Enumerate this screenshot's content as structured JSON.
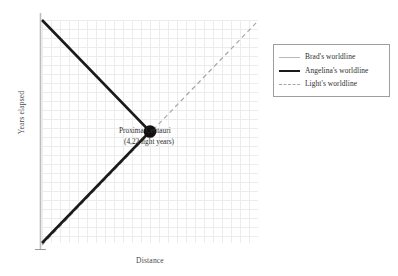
{
  "chart_data": {
    "type": "line",
    "title": "",
    "xlabel": "Distance",
    "ylabel": "Years elapsed",
    "grid": true,
    "legend_position": "right",
    "xlim": [
      0,
      8.44
    ],
    "ylim": [
      0,
      8.72
    ],
    "annotations": [
      {
        "name": "proxima-centauri",
        "line1": "Proxima Centauri",
        "line2": "(4,22 light years)",
        "x": 4.22,
        "y": 4.36,
        "marker": "filled-circle",
        "marker_color": "#101010"
      }
    ],
    "series": [
      {
        "name": "Brad's worldline",
        "legend_label": "Brad's worldline",
        "style": "solid",
        "width": 1.6,
        "color": "#bcbcbc",
        "points": [
          [
            0,
            0
          ],
          [
            0,
            8.72
          ]
        ]
      },
      {
        "name": "Angelina's worldline",
        "legend_label": "Angelina's worldline",
        "style": "solid",
        "width": 2.6,
        "color": "#1a1a1a",
        "points": [
          [
            0,
            0
          ],
          [
            4.22,
            4.36
          ],
          [
            0,
            8.72
          ]
        ]
      },
      {
        "name": "Light's worldline",
        "legend_label": "Light's worldline",
        "style": "dashed",
        "width": 1.2,
        "color": "#a8a8a8",
        "points": [
          [
            0,
            0
          ],
          [
            8.44,
            8.72
          ]
        ]
      }
    ]
  },
  "axes": {
    "ylabel": "Years elapsed",
    "xlabel": "Distance"
  },
  "annotation": {
    "line1": "Proxima Centauri",
    "line2": "(4,22 light years)"
  },
  "legend": {
    "items": [
      {
        "label": "Brad's worldline",
        "swatch": "solid-thin",
        "color": "#bcbcbc"
      },
      {
        "label": "Angelina's worldline",
        "swatch": "solid-thick",
        "color": "#1a1a1a"
      },
      {
        "label": "Light's worldline",
        "swatch": "dashed",
        "color": "#a8a8a8"
      }
    ]
  },
  "colors": {
    "background": "#ffffff",
    "grid": "#ececec",
    "axis": "#9a9a9a",
    "legend_border": "#9e9e9e",
    "text": "#2d2d2d"
  }
}
